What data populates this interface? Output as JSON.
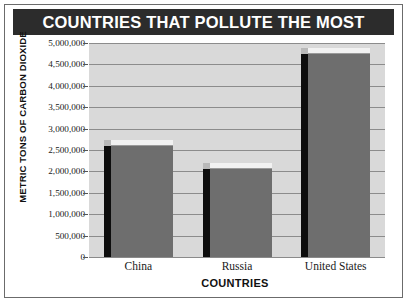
{
  "chart_data": {
    "type": "bar",
    "title": "COUNTRIES THAT POLLUTE THE MOST",
    "xlabel": "COUNTRIES",
    "ylabel": "METRIC TONS OF CARBON DIOXIDE",
    "categories": [
      "China",
      "Russia",
      "United States"
    ],
    "values": [
      2600000,
      2050000,
      4750000
    ],
    "ylim": [
      0,
      5000000
    ],
    "ytick_labels": [
      "5,000,000",
      "4,500,000",
      "4,000,000",
      "3,500,000",
      "3,000,000",
      "2,500,000",
      "2,000,000",
      "1,500,000",
      "1,000,000",
      "500,000",
      "0"
    ],
    "ytick_values": [
      5000000,
      4500000,
      4000000,
      3500000,
      3000000,
      2500000,
      2000000,
      1500000,
      1000000,
      500000,
      0
    ],
    "grid": true,
    "legend": false,
    "style": "3d-bar",
    "colors": {
      "title_band_bg": "#2c2c2c",
      "title_text": "#ffffff",
      "plot_bg": "#d9d9d9",
      "gridline": "#8c8c8c",
      "bar_front": "#6e6e6e",
      "bar_side": "#0d0d0d",
      "bar_top": "#f2f2f2",
      "frame_border": "#6b6b6b",
      "text": "#1a1a1a"
    }
  }
}
